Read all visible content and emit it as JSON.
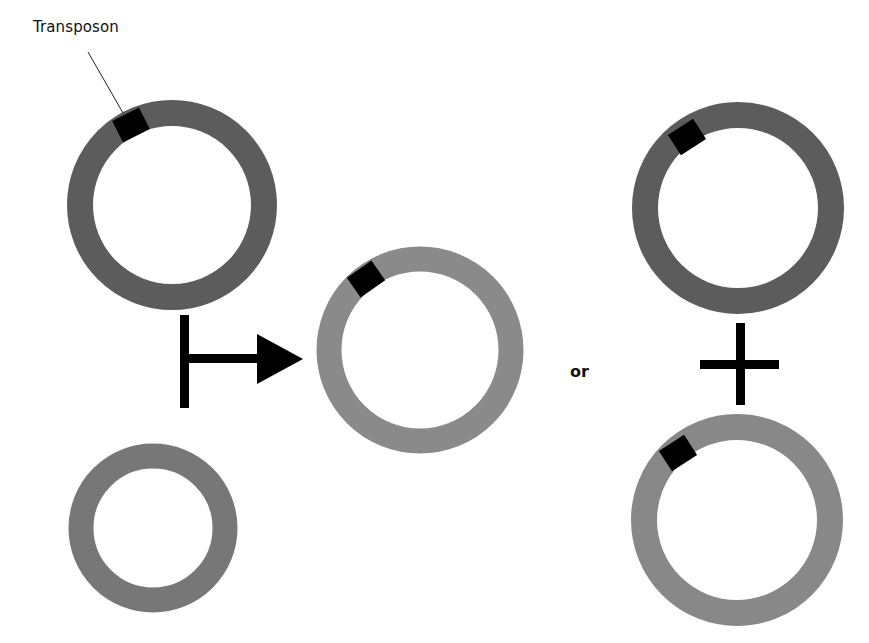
{
  "diagram": {
    "type": "transposition-outcome",
    "labels": {
      "transposon": "Transposon",
      "or": "or"
    },
    "colors": {
      "dark_ring": "#5c5c5c",
      "medium_ring": "#777777",
      "light_ring": "#8a8a8a",
      "transposon_block": "#000000",
      "symbol": "#000000",
      "background": "#ffffff"
    },
    "elements": [
      {
        "id": "donor-plasmid",
        "kind": "plasmid",
        "has_transposon": true,
        "shade": "dark",
        "position": "top-left"
      },
      {
        "id": "target-plasmid",
        "kind": "plasmid",
        "has_transposon": false,
        "shade": "medium",
        "position": "bottom-left"
      },
      {
        "id": "arrow",
        "kind": "process-arrow",
        "position": "center-left"
      },
      {
        "id": "cointegrate-plasmid",
        "kind": "plasmid",
        "has_transposon": true,
        "shade": "light",
        "position": "center"
      },
      {
        "id": "or-text",
        "kind": "label",
        "position": "center-right"
      },
      {
        "id": "product-donor-plasmid",
        "kind": "plasmid",
        "has_transposon": true,
        "shade": "dark",
        "position": "top-right"
      },
      {
        "id": "plus-sign",
        "kind": "operator",
        "position": "right"
      },
      {
        "id": "product-target-plasmid",
        "kind": "plasmid",
        "has_transposon": true,
        "shade": "light",
        "position": "bottom-right"
      }
    ]
  }
}
